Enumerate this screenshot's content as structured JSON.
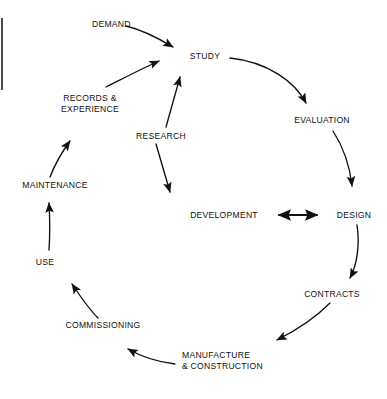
{
  "diagram": {
    "type": "cycle-flow-diagram",
    "stroke_color": "#111111",
    "background_color": "#ffffff",
    "nodes": [
      {
        "id": "demand",
        "label": "DEMAND",
        "x": 92,
        "y": 23,
        "align": "left"
      },
      {
        "id": "study",
        "label": "STUDY",
        "x": 205,
        "y": 55,
        "align": "center"
      },
      {
        "id": "evaluation",
        "label": "EVALUATION",
        "x": 322,
        "y": 119,
        "align": "center"
      },
      {
        "id": "design",
        "label": "DESIGN",
        "x": 354,
        "y": 214,
        "align": "center"
      },
      {
        "id": "development",
        "label": "DEVELOPMENT",
        "x": 224,
        "y": 214,
        "align": "center"
      },
      {
        "id": "contracts",
        "label": "CONTRACTS",
        "x": 332,
        "y": 293,
        "align": "center"
      },
      {
        "id": "manufacture",
        "label": "MANUFACTURE\n& CONSTRUCTION",
        "x": 182,
        "y": 354,
        "align": "left"
      },
      {
        "id": "commissioning",
        "label": "COMMISSIONING",
        "x": 103,
        "y": 324,
        "align": "center"
      },
      {
        "id": "use",
        "label": "USE",
        "x": 45,
        "y": 261,
        "align": "center"
      },
      {
        "id": "maintenance",
        "label": "MAINTENANCE",
        "x": 55,
        "y": 184,
        "align": "center"
      },
      {
        "id": "records",
        "label": "RECORDS &\nEXPERIENCE",
        "x": 90,
        "y": 97,
        "align": "center"
      },
      {
        "id": "research",
        "label": "RESEARCH",
        "x": 161,
        "y": 135,
        "align": "center"
      }
    ],
    "edges": [
      {
        "id": "demand-to-study",
        "from": "demand",
        "to": "study",
        "style": "curve",
        "arrow": "end"
      },
      {
        "id": "study-to-evaluation",
        "from": "study",
        "to": "evaluation",
        "style": "curve",
        "arrow": "end"
      },
      {
        "id": "evaluation-to-design",
        "from": "evaluation",
        "to": "design",
        "style": "curve",
        "arrow": "end"
      },
      {
        "id": "design-to-contracts",
        "from": "design",
        "to": "contracts",
        "style": "curve",
        "arrow": "end"
      },
      {
        "id": "contracts-to-manufacture",
        "from": "contracts",
        "to": "manufacture",
        "style": "curve",
        "arrow": "end"
      },
      {
        "id": "manufacture-to-commissioning",
        "from": "manufacture",
        "to": "commissioning",
        "style": "curve",
        "arrow": "end"
      },
      {
        "id": "commissioning-to-use",
        "from": "commissioning",
        "to": "use",
        "style": "curve",
        "arrow": "end"
      },
      {
        "id": "use-to-maintenance",
        "from": "use",
        "to": "maintenance",
        "style": "curve",
        "arrow": "end"
      },
      {
        "id": "maintenance-to-records",
        "from": "maintenance",
        "to": "records",
        "style": "curve",
        "arrow": "end"
      },
      {
        "id": "records-to-study",
        "from": "records",
        "to": "study",
        "style": "curve",
        "arrow": "end"
      },
      {
        "id": "research-to-study",
        "from": "research",
        "to": "study",
        "style": "line",
        "arrow": "end"
      },
      {
        "id": "research-to-development",
        "from": "research",
        "to": "development",
        "style": "line",
        "arrow": "end"
      },
      {
        "id": "development-design-bidirectional",
        "from": "development",
        "to": "design",
        "style": "line",
        "arrow": "both"
      }
    ]
  }
}
